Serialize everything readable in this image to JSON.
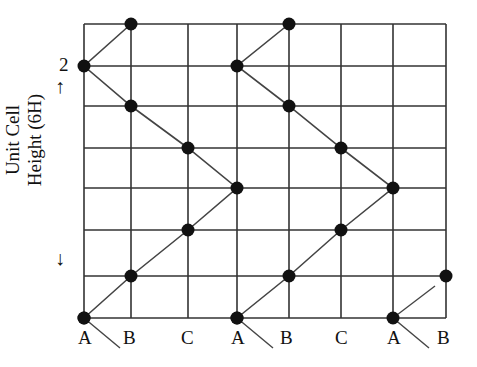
{
  "diagram": {
    "y_axis": {
      "label_line1": "Unit Cell",
      "label_line2": "Height (6H)",
      "tick_label": "2",
      "arrow_up": "↑",
      "arrow_down": "↓"
    },
    "x_labels": [
      "A",
      "B",
      "C",
      "A",
      "B",
      "C",
      "A",
      "B"
    ],
    "colors": {
      "grid": "#333333",
      "atom": "#111111",
      "line": "#444444"
    },
    "grid": {
      "columns_x": [
        84,
        131,
        188,
        237,
        289,
        341,
        393,
        446
      ],
      "rows_y": [
        24,
        66,
        106,
        148,
        188,
        230,
        276,
        318
      ]
    },
    "chains": [
      {
        "name": "chain-1",
        "points": [
          [
            84,
            318
          ],
          [
            131,
            276
          ],
          [
            188,
            230
          ],
          [
            237,
            188
          ],
          [
            188,
            148
          ],
          [
            131,
            106
          ],
          [
            84,
            66
          ],
          [
            131,
            24
          ]
        ]
      },
      {
        "name": "chain-2",
        "points": [
          [
            237,
            318
          ],
          [
            289,
            276
          ],
          [
            341,
            230
          ],
          [
            393,
            188
          ],
          [
            341,
            148
          ],
          [
            289,
            106
          ],
          [
            237,
            66
          ],
          [
            289,
            24
          ]
        ]
      }
    ],
    "extra_atom": [
      446,
      276
    ],
    "extra_atom_origin": [
      393,
      318
    ]
  }
}
